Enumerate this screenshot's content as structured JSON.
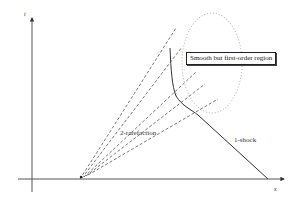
{
  "diagram": {
    "axes": {
      "vertical_label": "t",
      "horizontal_label": "x"
    },
    "labels": {
      "callout": "Smooth but first-order region",
      "rarefaction": "2-rarefaction",
      "shock": "1-shock"
    },
    "colors": {
      "axis": "#444444",
      "curve": "#333333",
      "dashed_fan": "#555555",
      "dotted_ellipse": "#888888",
      "background": "#ffffff"
    },
    "geometry": {
      "fan_origin": [
        80,
        179
      ],
      "fan_count": 5,
      "ellipse_center": [
        212,
        63
      ],
      "ellipse_radii": [
        30,
        50
      ]
    }
  }
}
